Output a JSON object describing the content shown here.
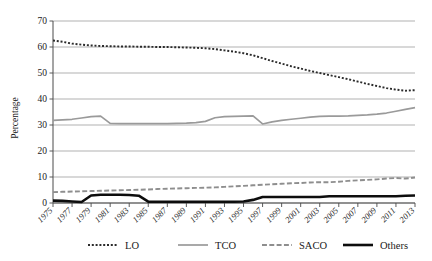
{
  "chart_data": {
    "type": "line",
    "title": "",
    "xlabel": "",
    "ylabel": "Percentage",
    "ylim": [
      0,
      70
    ],
    "ytick_step": 10,
    "yticks": [
      0,
      10,
      20,
      30,
      40,
      50,
      60,
      70
    ],
    "grid": "horizontal",
    "legend_position": "bottom",
    "x": [
      1975,
      1976,
      1977,
      1978,
      1979,
      1980,
      1981,
      1982,
      1983,
      1984,
      1985,
      1986,
      1987,
      1988,
      1989,
      1990,
      1991,
      1992,
      1993,
      1994,
      1995,
      1996,
      1997,
      1998,
      1999,
      2000,
      2001,
      2002,
      2003,
      2004,
      2005,
      2006,
      2007,
      2008,
      2009,
      2010,
      2011,
      2012,
      2013
    ],
    "xticks": [
      1975,
      1977,
      1979,
      1981,
      1983,
      1985,
      1987,
      1989,
      1991,
      1993,
      1995,
      1997,
      1999,
      2001,
      2003,
      2005,
      2007,
      2009,
      2011,
      2013
    ],
    "xtick_labels": [
      "1975",
      "1977",
      "1979",
      "1981",
      "1983",
      "1985",
      "1987",
      "1989",
      "1991",
      "1993",
      "1995",
      "1997",
      "1999",
      "2001",
      "2003",
      "2005",
      "2007",
      "2009",
      "2011",
      "2013"
    ],
    "series": [
      {
        "name": "LO",
        "style": "dotted",
        "color": "#2b2b2b",
        "width": 1.9,
        "values": [
          62.5,
          62.0,
          61.3,
          60.9,
          60.6,
          60.4,
          60.3,
          60.2,
          60.2,
          60.1,
          60.1,
          60.0,
          60.0,
          59.9,
          59.8,
          59.7,
          59.5,
          59.2,
          58.7,
          58.2,
          57.6,
          56.8,
          55.7,
          54.6,
          53.6,
          52.6,
          51.7,
          50.8,
          50.0,
          49.2,
          48.4,
          47.6,
          46.7,
          45.8,
          45.0,
          44.2,
          43.6,
          43.2,
          43.4
        ]
      },
      {
        "name": "TCO",
        "style": "solid",
        "color": "#9a9a9a",
        "width": 1.7,
        "values": [
          31.8,
          32.0,
          32.2,
          32.7,
          33.2,
          33.4,
          30.6,
          30.5,
          30.5,
          30.5,
          30.5,
          30.5,
          30.5,
          30.6,
          30.7,
          30.9,
          31.4,
          32.8,
          33.2,
          33.3,
          33.4,
          33.5,
          30.4,
          31.2,
          31.8,
          32.2,
          32.6,
          33.0,
          33.3,
          33.4,
          33.4,
          33.5,
          33.7,
          33.9,
          34.2,
          34.6,
          35.3,
          36.0,
          36.7
        ]
      },
      {
        "name": "SACO",
        "style": "dashed",
        "color": "#8e8e8e",
        "width": 1.9,
        "values": [
          4.2,
          4.3,
          4.4,
          4.5,
          4.6,
          4.7,
          4.8,
          4.9,
          5.0,
          5.1,
          5.2,
          5.4,
          5.5,
          5.6,
          5.7,
          5.8,
          5.9,
          6.0,
          6.2,
          6.4,
          6.6,
          6.8,
          7.0,
          7.2,
          7.4,
          7.6,
          7.7,
          7.9,
          8.0,
          8.0,
          8.2,
          8.5,
          8.7,
          8.9,
          9.1,
          9.4,
          9.6,
          9.4,
          9.8
        ]
      },
      {
        "name": "Others",
        "style": "solid",
        "color": "#0d0d0d",
        "width": 2.6,
        "values": [
          0.9,
          0.8,
          0.6,
          0.4,
          2.9,
          3.2,
          3.2,
          3.2,
          3.1,
          2.8,
          0.5,
          0.5,
          0.5,
          0.5,
          0.5,
          0.5,
          0.5,
          0.5,
          0.5,
          0.5,
          0.6,
          1.2,
          2.3,
          2.3,
          2.3,
          2.3,
          2.3,
          2.3,
          2.3,
          2.6,
          2.6,
          2.6,
          2.6,
          2.6,
          2.6,
          2.6,
          2.6,
          2.8,
          2.9
        ]
      }
    ]
  },
  "legend": {
    "items": [
      {
        "label": "LO",
        "series": "LO"
      },
      {
        "label": "TCO",
        "series": "TCO"
      },
      {
        "label": "SACO",
        "series": "SACO"
      },
      {
        "label": "Others",
        "series": "Others"
      }
    ]
  },
  "colors": {
    "grid": "#a8a8a8",
    "axis": "#4a4a4a",
    "text": "#1a1a1a",
    "background": "#ffffff"
  }
}
